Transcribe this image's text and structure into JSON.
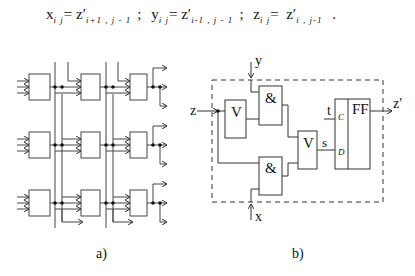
{
  "formula": {
    "terms": [
      {
        "lhs": "x",
        "lhs_sub": "i j",
        "rhs": "z′",
        "rhs_sub": "i+1 , j - 1"
      },
      {
        "lhs": "y",
        "lhs_sub": "i j",
        "rhs": "z′",
        "rhs_sub": "i-1 , j - 1"
      },
      {
        "lhs": "z",
        "lhs_sub": "i j",
        "rhs": "z′",
        "rhs_sub": "i , j-1"
      }
    ],
    "separator": ";",
    "terminator": "."
  },
  "diagram_a": {
    "caption": "a)",
    "grid_rows": 3,
    "grid_cols": 3
  },
  "diagram_b": {
    "caption": "b)",
    "inputs": {
      "z": "z",
      "y": "y",
      "x": "x",
      "t": "t"
    },
    "output": "z′",
    "gates": {
      "or1": "V",
      "and1": "&",
      "and2": "&",
      "or2": "V"
    },
    "flipflop": {
      "label": "FF",
      "clock_pin": "C",
      "data_pin": "D"
    },
    "signal_s": "s"
  },
  "colors": {
    "stroke": "#333333",
    "background": "#ffffff"
  }
}
